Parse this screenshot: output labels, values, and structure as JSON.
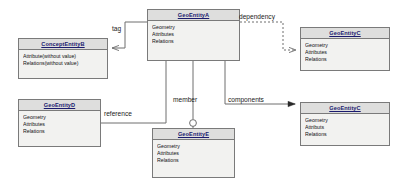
{
  "diagram": {
    "background": "#ffffff",
    "header_fill": "#dededd",
    "body_fill": "#f2f2f0",
    "stroke": "#7a7a7a",
    "title_color": "#1a1a6e"
  },
  "entities": [
    {
      "id": "geoEntityA",
      "name": "GeoEntityA",
      "attributes": [
        "Geometry",
        "Attributes",
        "Relations"
      ],
      "x": 147,
      "y": 9,
      "w": 93,
      "h": 52
    },
    {
      "id": "conceptEntityB",
      "name": "ConceptEntityB",
      "attributes": [
        "Attribute(without value)",
        "Relations(without value)"
      ],
      "x": 18,
      "y": 38,
      "w": 90,
      "h": 41
    },
    {
      "id": "geoEntityC1",
      "name": "GeoEntityC",
      "attributes": [
        "Geometry",
        "Attributes",
        "Relations"
      ],
      "x": 300,
      "y": 27,
      "w": 90,
      "h": 44
    },
    {
      "id": "geoEntityC2",
      "name": "GeoEntityC",
      "attributes": [
        "Geometry",
        "Attributs",
        "Relations"
      ],
      "x": 300,
      "y": 102,
      "w": 90,
      "h": 44
    },
    {
      "id": "geoEntityD",
      "name": "GeoEntityD",
      "attributes": [
        "Geometry",
        "Attributes",
        "Relations"
      ],
      "x": 18,
      "y": 99,
      "w": 83,
      "h": 48
    },
    {
      "id": "geoEntityE",
      "name": "GeoEntityE",
      "attributes": [
        "Geometry",
        "Attributes",
        "Relations"
      ],
      "x": 152,
      "y": 128,
      "w": 83,
      "h": 50
    }
  ],
  "relations": [
    {
      "id": "tag",
      "label": "tag",
      "from": "geoEntityA",
      "to": "conceptEntityB",
      "line": "solid",
      "arrow": "open",
      "label_x": 112,
      "label_y": 25
    },
    {
      "id": "dependency",
      "label": "dependency",
      "from": "geoEntityA",
      "to": "geoEntityC1",
      "line": "dotted",
      "arrow": "open",
      "label_x": 239,
      "label_y": 13
    },
    {
      "id": "member",
      "label": "member",
      "from": "geoEntityA",
      "to": "geoEntityE",
      "line": "solid",
      "arrow": "circle",
      "label_x": 173,
      "label_y": 96
    },
    {
      "id": "reference",
      "label": "reference",
      "from": "geoEntityD",
      "to": "geoEntityA",
      "line": "solid",
      "arrow": "none",
      "label_x": 104,
      "label_y": 110
    },
    {
      "id": "components",
      "label": "components",
      "from": "geoEntityA",
      "to": "geoEntityC2",
      "line": "solid",
      "arrow": "filled",
      "label_x": 228,
      "label_y": 96
    }
  ]
}
